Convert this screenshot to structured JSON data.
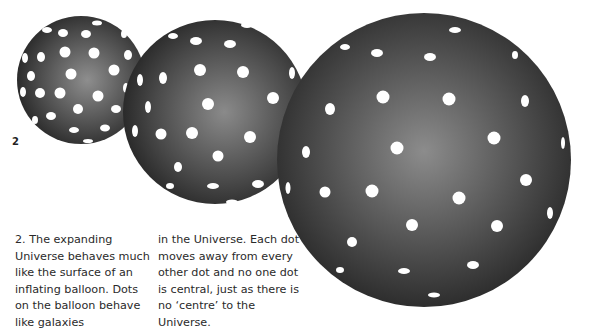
{
  "figure": {
    "label": "2",
    "balloons": [
      {
        "name": "small",
        "cx": 81,
        "cy": 80,
        "r": 64
      },
      {
        "name": "medium",
        "cx": 215,
        "cy": 112,
        "r": 92
      },
      {
        "name": "large",
        "cx": 424,
        "cy": 160,
        "r": 147
      }
    ],
    "colors": {
      "balloon_edge": "#2b2b2b",
      "balloon_center": "#8e8e8e",
      "dot": "#ffffff"
    }
  },
  "caption": {
    "col1": "2. The expanding Universe behaves much like the surface of an inflating balloon. Dots on the balloon behave like galaxies",
    "col2": "in the Universe. Each dot moves away from every other dot and no one dot is central, just as there is no ‘centre’ to the Universe."
  }
}
